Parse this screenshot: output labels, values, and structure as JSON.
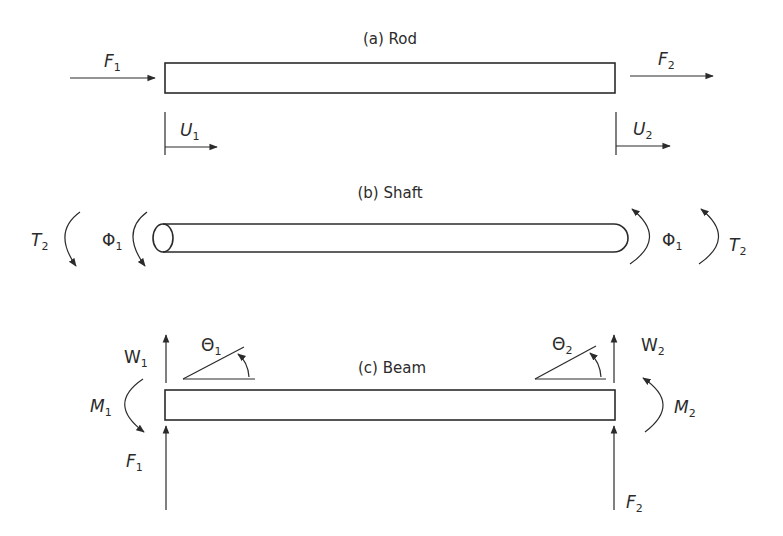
{
  "diagram": {
    "colors": {
      "line": "#2b2b2b",
      "background": "#ffffff"
    },
    "panels": {
      "rod": {
        "title": "(a) Rod",
        "labels": {
          "f1": "F",
          "f1_sub": "1",
          "f2": "F",
          "f2_sub": "2",
          "u1": "U",
          "u1_sub": "1",
          "u2": "U",
          "u2_sub": "2"
        }
      },
      "shaft": {
        "title": "(b) Shaft",
        "labels": {
          "t_left": "T",
          "t_left_sub": "2",
          "phi_left": "Φ",
          "phi_left_sub": "1",
          "phi_right": "Φ",
          "phi_right_sub": "1",
          "t_right": "T",
          "t_right_sub": "2"
        }
      },
      "beam": {
        "title": "(c) Beam",
        "labels": {
          "w1": "W",
          "w1_sub": "1",
          "w2": "W",
          "w2_sub": "2",
          "theta1": "Θ",
          "theta1_sub": "1",
          "theta2": "Θ",
          "theta2_sub": "2",
          "m1": "M",
          "m1_sub": "1",
          "m2": "M",
          "m2_sub": "2",
          "f1": "F",
          "f1_sub": "1",
          "f2": "F",
          "f2_sub": "2"
        }
      }
    }
  }
}
